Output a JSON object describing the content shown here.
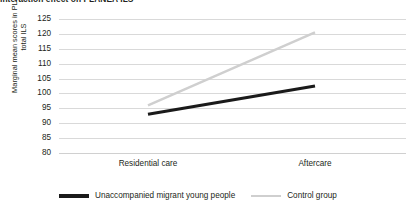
{
  "chart_data": {
    "type": "line",
    "title": "Interaction effect on PLANEA ILS",
    "xlabel": "",
    "ylabel": "Marginal mean scores in PLANEA total ILS",
    "categories": [
      "Residential care",
      "Aftercare"
    ],
    "ylim": [
      80,
      125
    ],
    "yticks": [
      125,
      120,
      115,
      110,
      105,
      100,
      95,
      90,
      85,
      80
    ],
    "grid": true,
    "legend_position": "bottom",
    "series": [
      {
        "name": "Unaccompanied migrant young people",
        "values": [
          93.0,
          102.5
        ],
        "color": "#1a1a1a",
        "width": 3.2
      },
      {
        "name": "Control group",
        "values": [
          96.0,
          120.5
        ],
        "color": "#cfcfcf",
        "width": 2.4
      }
    ]
  },
  "axis": {
    "y_title_line1": "Marginal mean scores in PLANEA",
    "y_title_line2": "total ILS"
  },
  "legend": {
    "entries": [
      {
        "label": "Unaccompanied migrant young people",
        "swatch": "line-swatch-black"
      },
      {
        "label": "Control group",
        "swatch": "line-swatch-gray"
      }
    ]
  }
}
